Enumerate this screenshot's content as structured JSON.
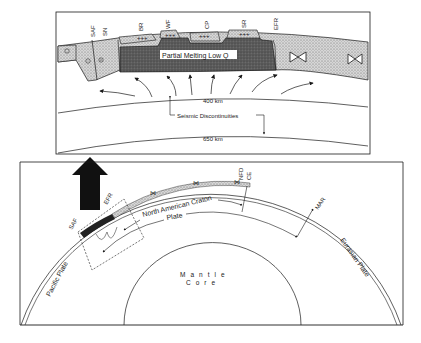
{
  "top_panel": {
    "fault_labels": {
      "saf": "SAF",
      "sn": "SN",
      "br": "BR",
      "wf": "WF",
      "cp": "CP",
      "sr": "SR",
      "efr": "EFR"
    },
    "partial_melting": "Partial Melting Low Q",
    "depth_400": "400 km",
    "depth_650": "650 km",
    "seismic_discontinuities": "Seismic Discontinuities"
  },
  "bottom_panel": {
    "north_american_craton": "North American Craton",
    "plate": "Plate",
    "pacific_plate": "Pacific Plate",
    "eurasian_plate": "Eurasian Plate",
    "mar": "MAR",
    "nfd": "NFD",
    "ce": "CE",
    "mantle": "Mantle",
    "core": "Core",
    "efr_small": "EFR",
    "saf_small": "SAF",
    "sn_small": "SN"
  },
  "colors": {
    "ink": "#1a1a1a",
    "stipple_light": "#c8c8c8",
    "melting_zone": "#5a5a5a",
    "background": "#ffffff"
  }
}
